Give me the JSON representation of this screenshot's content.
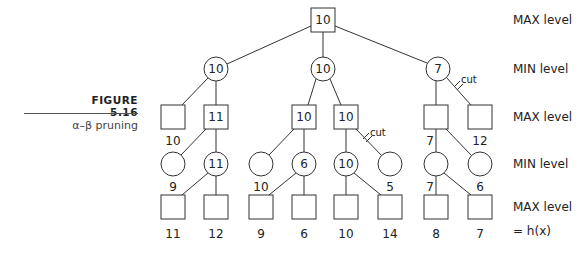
{
  "caption": {
    "figure_label": "FIGURE 5.16",
    "subtitle": "α–β pruning"
  },
  "levels": [
    {
      "label": "MAX level",
      "y": 24
    },
    {
      "label": "MIN level",
      "y": 73
    },
    {
      "label": "MAX level",
      "y": 121
    },
    {
      "label": "MIN level",
      "y": 168
    },
    {
      "label": "MAX level",
      "y": 211
    },
    {
      "label": "= h(x)",
      "y": 231
    }
  ],
  "cut_label": "cut",
  "tree": {
    "root": {
      "shape": "square",
      "value": "10"
    },
    "min1": [
      {
        "shape": "circle",
        "value": "10"
      },
      {
        "shape": "circle",
        "value": "10"
      },
      {
        "shape": "circle",
        "value": "7"
      }
    ],
    "max2": [
      {
        "shape": "square",
        "value": "",
        "below": "10"
      },
      {
        "shape": "square",
        "value": "11",
        "below": ""
      },
      {
        "shape": "square",
        "value": "10",
        "below": ""
      },
      {
        "shape": "square",
        "value": "10",
        "below": ""
      },
      {
        "shape": "square",
        "value": "",
        "below": "7"
      },
      {
        "shape": "square",
        "value": "",
        "below": "12",
        "cut": true
      }
    ],
    "min3": [
      {
        "shape": "circle",
        "value": "",
        "below": "9"
      },
      {
        "shape": "circle",
        "value": "11",
        "below": ""
      },
      {
        "shape": "circle",
        "value": "",
        "below": "10"
      },
      {
        "shape": "circle",
        "value": "6",
        "below": ""
      },
      {
        "shape": "circle",
        "value": "10",
        "below": ""
      },
      {
        "shape": "circle",
        "value": "",
        "below": "5",
        "cut": true
      },
      {
        "shape": "circle",
        "value": "",
        "below": "7"
      },
      {
        "shape": "circle",
        "value": "",
        "below": "6"
      }
    ],
    "leaves": [
      {
        "shape": "square",
        "below": "11"
      },
      {
        "shape": "square",
        "below": "12"
      },
      {
        "shape": "square",
        "below": "9"
      },
      {
        "shape": "square",
        "below": "6"
      },
      {
        "shape": "square",
        "below": "10"
      },
      {
        "shape": "square",
        "below": "14"
      },
      {
        "shape": "square",
        "below": "8"
      },
      {
        "shape": "square",
        "below": "7"
      }
    ]
  }
}
